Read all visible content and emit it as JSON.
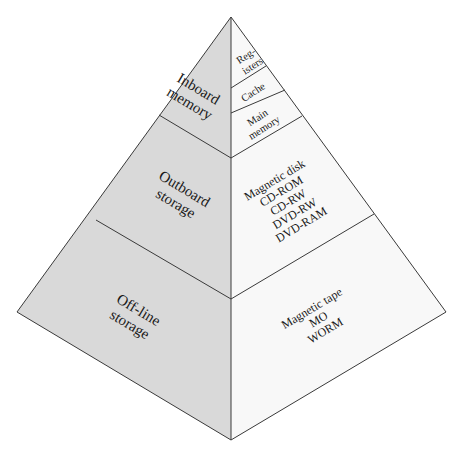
{
  "diagram": {
    "colors": {
      "left_face": "#d9d9d9",
      "right_face": "#f8f8f8",
      "edges": "#3a3a3a",
      "text": "#1a1a1a"
    },
    "tiers": [
      {
        "category": {
          "lines": [
            "Inboard",
            "memory"
          ]
        },
        "examples": [
          {
            "lines": [
              "Reg-",
              "isters"
            ]
          },
          {
            "lines": [
              "Cache"
            ]
          },
          {
            "lines": [
              "Main",
              "memory"
            ]
          }
        ]
      },
      {
        "category": {
          "lines": [
            "Outboard",
            "storage"
          ]
        },
        "examples": [
          {
            "lines": [
              "Magnetic disk",
              "CD-ROM",
              "CD-RW",
              "DVD-RW",
              "DVD-RAM"
            ]
          }
        ]
      },
      {
        "category": {
          "lines": [
            "Off-line",
            "storage"
          ]
        },
        "examples": [
          {
            "lines": [
              "Magnetic tape",
              "MO",
              "WORM"
            ]
          }
        ]
      }
    ]
  }
}
